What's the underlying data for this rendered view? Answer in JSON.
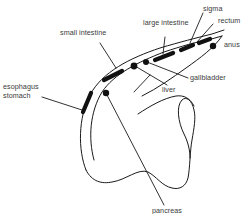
{
  "diagram": {
    "type": "anatomical-line-drawing",
    "colors": {
      "ink": "#1a1a1a",
      "label": "#3a3a3a",
      "background": "#ffffff"
    },
    "labels": {
      "sigma": "sigma",
      "large_intestine": "large intestine",
      "rectum": "rectum",
      "anus": "anus",
      "small_intestine": "small intestine",
      "gallbladder": "gallbladder",
      "liver": "liver",
      "esophagus": "esophagus",
      "stomach": "stomach",
      "pancreas": "pancreas"
    },
    "markers": [
      {
        "name": "esophagus-stomach-segment",
        "shape": "dash"
      },
      {
        "name": "small-intestine-segment",
        "shape": "dash"
      },
      {
        "name": "pancreas-dot",
        "shape": "dot"
      },
      {
        "name": "liver-dot",
        "shape": "dot"
      },
      {
        "name": "gallbladder-dot",
        "shape": "dot"
      },
      {
        "name": "large-intestine-segment",
        "shape": "dash"
      },
      {
        "name": "sigma-segment",
        "shape": "dash"
      },
      {
        "name": "rectum-segment",
        "shape": "dash"
      },
      {
        "name": "anus-dot",
        "shape": "dot"
      }
    ]
  }
}
